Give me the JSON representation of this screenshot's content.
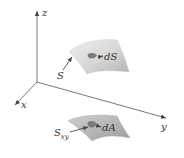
{
  "diagram": {
    "type": "3d-surface-projection",
    "axes": {
      "x_label": "x",
      "y_label": "y",
      "z_label": "z"
    },
    "surface": {
      "label": "S",
      "element_label": "dS"
    },
    "projection": {
      "label_main": "S",
      "label_sub": "xy",
      "element_label": "dA"
    },
    "colors": {
      "surface_light": "#e4e4e4",
      "surface_dark": "#b8b8b8",
      "projection_light": "#c8c8c8",
      "projection_dark": "#9a9a9a",
      "element_patch": "#7a7a7a",
      "axis": "#555555",
      "text": "#333333"
    }
  }
}
